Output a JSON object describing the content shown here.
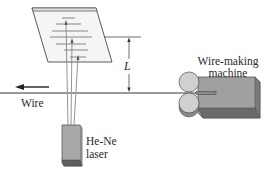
{
  "figure": {
    "labels": {
      "distance": "L",
      "wire": "Wire",
      "laser_line1": "He-Ne",
      "laser_line2": "laser",
      "machine_line1": "Wire-making",
      "machine_line2": "machine"
    },
    "components": [
      {
        "name": "screen",
        "description": "tilted screen showing diffraction pattern lines"
      },
      {
        "name": "laser",
        "description": "He-Ne laser emitting beams upward past the wire"
      },
      {
        "name": "wire",
        "description": "horizontal wire moving left"
      },
      {
        "name": "wire-making-machine",
        "description": "box with rollers producing wire"
      },
      {
        "name": "distance-L",
        "description": "distance from wire to screen"
      }
    ],
    "colors": {
      "screen_fill": "#f4f4f4",
      "screen_edge": "#4a4a4a",
      "wire": "#9a9a9a",
      "laser_front": "#a8a8a8",
      "laser_bottom": "#5e5e5e",
      "machine_top": "#b6b6b6",
      "machine_front": "#9a9a9a",
      "machine_side": "#6a6a6a",
      "roller": "#cfcfcf",
      "text": "#2a2a2a"
    }
  }
}
